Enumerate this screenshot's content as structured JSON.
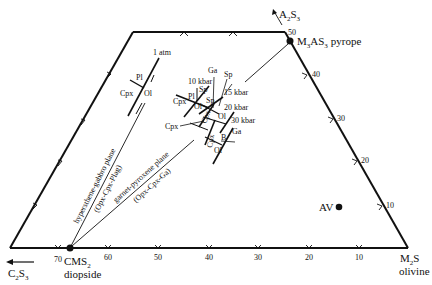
{
  "diagram": {
    "type": "phase-projection (CMAS tetrahedron projection)",
    "vertices": {
      "pyrope": {
        "formula_main": "M",
        "formula_sub1": "3",
        "formula_mid": "AS",
        "formula_sub2": "3",
        "name": "pyrope"
      },
      "a2s3": {
        "main": "A",
        "sub1": "2",
        "mid": "S",
        "sub2": "3"
      },
      "diopside": {
        "main": "CMS",
        "sub": "2",
        "name": "diopside"
      },
      "c2s3": {
        "main": "C",
        "sub1": "2",
        "mid": "S",
        "sub2": "3"
      },
      "olivine": {
        "main": "M",
        "sub": "2",
        "tail": "S",
        "name": "olivine"
      }
    },
    "point_av": "AV",
    "bottom_ticks": [
      "70",
      "60",
      "50",
      "40",
      "30",
      "20",
      "10"
    ],
    "right_ticks": [
      "50",
      "40",
      "30",
      "20",
      "10"
    ],
    "planes": {
      "hyp_gabbro": "hypersthene-gabbro plane",
      "hyp_gabbro_sub": "(Opx-Cpx-Plag)",
      "garnet_px": "garnet-pyroxene plane",
      "garnet_px_sub": "(Opx-Cpx-Ga)"
    },
    "pressures": {
      "p1": "1 atm",
      "p10": "10 kbar",
      "p15": "15 kbar",
      "p20": "20 kbar",
      "p30": "30 kbar"
    },
    "phases": {
      "pl": "Pl",
      "cpx": "Cpx",
      "ol": "Ol",
      "sp": "Sp",
      "ga": "Ga",
      "b": "B"
    }
  }
}
